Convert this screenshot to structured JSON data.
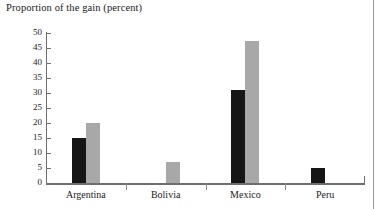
{
  "chart_data": {
    "type": "bar",
    "title": "Proportion of the gain (percent)",
    "xlabel": "",
    "ylabel": "",
    "ylim": [
      0,
      50
    ],
    "yticks": [
      0,
      5,
      10,
      15,
      20,
      25,
      30,
      35,
      40,
      45,
      50
    ],
    "grid": false,
    "legend": "none",
    "categories": [
      "Argentina",
      "Bolivia",
      "Mexico",
      "Peru"
    ],
    "series": [
      {
        "name": "series-1",
        "color": "#161616",
        "values": [
          15,
          0,
          31,
          5
        ]
      },
      {
        "name": "series-2",
        "color": "#a8a8a8",
        "values": [
          20,
          7,
          47.5,
          0
        ]
      }
    ]
  },
  "axis": {
    "tick_labels": [
      "50",
      "45",
      "40",
      "35",
      "30",
      "25",
      "20",
      "15",
      "10",
      "5",
      "0"
    ]
  }
}
